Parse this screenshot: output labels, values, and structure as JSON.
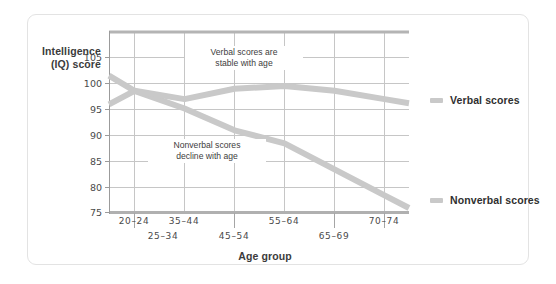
{
  "chart_data": {
    "type": "line",
    "title": "",
    "xlabel": "Age group",
    "ylabel": "Intelligence (IQ) score",
    "ylabel_line1": "Intelligence",
    "ylabel_line2": "(IQ) score",
    "categories": [
      "20–24",
      "25–34",
      "35–44",
      "45–54",
      "55–64",
      "65–69",
      "70–74"
    ],
    "yticks": [
      75,
      80,
      85,
      90,
      95,
      100,
      105
    ],
    "ylim": [
      75,
      108
    ],
    "grid": true,
    "legend_position": "right",
    "series": [
      {
        "name": "Verbal scores",
        "color": "#c9c9c9",
        "values": [
          96.0,
          98.6,
          97.0,
          99.0,
          99.5,
          98.6,
          97.0
        ]
      },
      {
        "name": "Nonverbal scores",
        "color": "#c9c9c9",
        "values": [
          101.5,
          98.6,
          95.2,
          91.0,
          88.5,
          83.5,
          78.5
        ]
      }
    ],
    "annotations": [
      {
        "id": "verbal-note",
        "line1": "Verbal scores are",
        "line2": "stable with age"
      },
      {
        "id": "nonverbal-note",
        "line1": "Nonverbal scores",
        "line2": "decline with age"
      }
    ]
  },
  "legend": {
    "items": [
      {
        "label": "Verbal scores",
        "color": "#c9c9c9"
      },
      {
        "label": "Nonverbal scores",
        "color": "#c9c9c9"
      }
    ]
  },
  "colors": {
    "frame_border": "#e3e3e3",
    "grid": "#c3c3c3",
    "axis": "#9b9b9b",
    "line": "#c9c9c9",
    "text": "#3b3b3b"
  }
}
